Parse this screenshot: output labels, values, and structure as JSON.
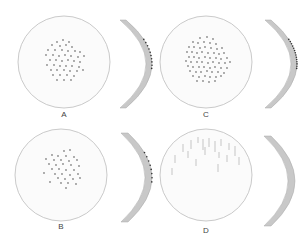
{
  "figure": {
    "colors": {
      "background": "#ffffff",
      "disc_fill": "#fbfbfb",
      "disc_outline": "#bdbdbd",
      "dot": "#8a8a8a",
      "streak": "#b0b0b0",
      "cross_section_fill": "#c8c8c8",
      "cross_section_edge": "#a8a8a8",
      "cross_section_marks": "#333333"
    },
    "panels": [
      {
        "id": "A",
        "label": "A",
        "pattern": "dots",
        "density": "moderate",
        "disc": {
          "cx": 64,
          "cy": 62,
          "r": 46
        },
        "label_pos": {
          "x": 54,
          "y": 110
        },
        "dots": [
          [
            57,
            42
          ],
          [
            63,
            40
          ],
          [
            69,
            42
          ],
          [
            52,
            45
          ],
          [
            60,
            46
          ],
          [
            66,
            45
          ],
          [
            72,
            47
          ],
          [
            48,
            50
          ],
          [
            55,
            50
          ],
          [
            62,
            50
          ],
          [
            68,
            51
          ],
          [
            75,
            51
          ],
          [
            80,
            52
          ],
          [
            46,
            55
          ],
          [
            53,
            55
          ],
          [
            59,
            56
          ],
          [
            65,
            55
          ],
          [
            71,
            56
          ],
          [
            78,
            57
          ],
          [
            84,
            56
          ],
          [
            50,
            60
          ],
          [
            56,
            60
          ],
          [
            62,
            61
          ],
          [
            68,
            60
          ],
          [
            74,
            61
          ],
          [
            80,
            62
          ],
          [
            47,
            65
          ],
          [
            54,
            65
          ],
          [
            60,
            66
          ],
          [
            66,
            66
          ],
          [
            72,
            66
          ],
          [
            79,
            67
          ],
          [
            51,
            70
          ],
          [
            57,
            70
          ],
          [
            64,
            70
          ],
          [
            70,
            71
          ],
          [
            77,
            71
          ],
          [
            83,
            70
          ],
          [
            53,
            75
          ],
          [
            60,
            75
          ],
          [
            67,
            75
          ],
          [
            74,
            76
          ],
          [
            57,
            80
          ],
          [
            64,
            80
          ],
          [
            71,
            80
          ]
        ],
        "cross_section": {
          "x": 120,
          "top": 20,
          "bottom": 108,
          "bulge": 26,
          "thickness": 6,
          "marks": 10
        }
      },
      {
        "id": "C",
        "label": "C",
        "pattern": "dots",
        "density": "dense",
        "disc": {
          "cx": 206,
          "cy": 62,
          "r": 46
        },
        "label_pos": {
          "x": 196,
          "y": 110
        },
        "dots": [
          [
            200,
            38
          ],
          [
            207,
            37
          ],
          [
            213,
            39
          ],
          [
            193,
            42
          ],
          [
            198,
            43
          ],
          [
            204,
            42
          ],
          [
            210,
            43
          ],
          [
            216,
            44
          ],
          [
            189,
            47
          ],
          [
            194,
            47
          ],
          [
            200,
            48
          ],
          [
            205,
            47
          ],
          [
            211,
            48
          ],
          [
            217,
            49
          ],
          [
            222,
            48
          ],
          [
            187,
            52
          ],
          [
            192,
            52
          ],
          [
            197,
            53
          ],
          [
            202,
            52
          ],
          [
            208,
            53
          ],
          [
            214,
            53
          ],
          [
            219,
            54
          ],
          [
            224,
            53
          ],
          [
            189,
            57
          ],
          [
            194,
            57
          ],
          [
            199,
            58
          ],
          [
            205,
            57
          ],
          [
            210,
            58
          ],
          [
            216,
            58
          ],
          [
            221,
            59
          ],
          [
            227,
            58
          ],
          [
            186,
            61
          ],
          [
            191,
            62
          ],
          [
            197,
            62
          ],
          [
            202,
            62
          ],
          [
            208,
            63
          ],
          [
            213,
            62
          ],
          [
            219,
            63
          ],
          [
            225,
            63
          ],
          [
            230,
            62
          ],
          [
            188,
            66
          ],
          [
            193,
            67
          ],
          [
            199,
            67
          ],
          [
            204,
            67
          ],
          [
            210,
            68
          ],
          [
            215,
            67
          ],
          [
            221,
            68
          ],
          [
            227,
            68
          ],
          [
            190,
            71
          ],
          [
            196,
            72
          ],
          [
            201,
            72
          ],
          [
            207,
            71
          ],
          [
            212,
            72
          ],
          [
            218,
            72
          ],
          [
            224,
            73
          ],
          [
            193,
            76
          ],
          [
            199,
            77
          ],
          [
            205,
            76
          ],
          [
            210,
            77
          ],
          [
            216,
            77
          ],
          [
            221,
            76
          ],
          [
            197,
            81
          ],
          [
            203,
            81
          ],
          [
            209,
            82
          ],
          [
            215,
            81
          ]
        ],
        "cross_section": {
          "x": 265,
          "top": 20,
          "bottom": 108,
          "bulge": 26,
          "thickness": 6,
          "marks": 14
        }
      },
      {
        "id": "B",
        "label": "B",
        "pattern": "dots",
        "density": "sparse",
        "disc": {
          "cx": 61,
          "cy": 175,
          "r": 46
        },
        "label_pos": {
          "x": 51,
          "y": 222
        },
        "dots": [
          [
            64,
            151
          ],
          [
            70,
            150
          ],
          [
            52,
            155
          ],
          [
            58,
            156
          ],
          [
            66,
            156
          ],
          [
            74,
            157
          ],
          [
            46,
            159
          ],
          [
            54,
            160
          ],
          [
            61,
            160
          ],
          [
            69,
            161
          ],
          [
            77,
            160
          ],
          [
            49,
            164
          ],
          [
            56,
            165
          ],
          [
            63,
            164
          ],
          [
            71,
            165
          ],
          [
            79,
            166
          ],
          [
            52,
            169
          ],
          [
            59,
            169
          ],
          [
            66,
            170
          ],
          [
            74,
            170
          ],
          [
            44,
            173
          ],
          [
            55,
            174
          ],
          [
            62,
            174
          ],
          [
            70,
            175
          ],
          [
            78,
            174
          ],
          [
            58,
            178
          ],
          [
            65,
            179
          ],
          [
            73,
            179
          ],
          [
            80,
            178
          ],
          [
            50,
            182
          ],
          [
            61,
            183
          ],
          [
            68,
            183
          ],
          [
            76,
            184
          ],
          [
            66,
            188
          ]
        ],
        "cross_section": {
          "x": 121,
          "top": 133,
          "bottom": 222,
          "bulge": 24,
          "thickness": 7,
          "marks": 8
        }
      },
      {
        "id": "D",
        "label": "D",
        "pattern": "streaks",
        "density": "scattered",
        "disc": {
          "cx": 206,
          "cy": 175,
          "r": 46
        },
        "label_pos": {
          "x": 196,
          "y": 226
        },
        "streaks": [
          [
            183,
            144,
            152
          ],
          [
            191,
            140,
            149
          ],
          [
            198,
            137,
            143
          ],
          [
            203,
            139,
            150
          ],
          [
            209,
            138,
            147
          ],
          [
            215,
            141,
            152
          ],
          [
            221,
            139,
            146
          ],
          [
            229,
            143,
            150
          ],
          [
            235,
            146,
            156
          ],
          [
            175,
            155,
            163
          ],
          [
            188,
            151,
            158
          ],
          [
            196,
            159,
            166
          ],
          [
            205,
            147,
            155
          ],
          [
            219,
            152,
            158
          ],
          [
            227,
            155,
            162
          ],
          [
            239,
            157,
            165
          ],
          [
            172,
            168,
            175
          ],
          [
            218,
            164,
            172
          ]
        ],
        "cross_section": {
          "x": 264,
          "top": 136,
          "bottom": 226,
          "bulge": 24,
          "thickness": 7,
          "marks": 0
        }
      }
    ]
  }
}
